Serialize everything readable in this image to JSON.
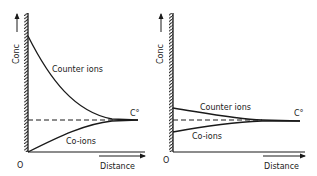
{
  "panels": [
    {
      "id": "left",
      "y_axis_label": "Conc",
      "x_axis_label": "Distance",
      "origin_label": "O",
      "bulk_label": "C°",
      "counter_label": "Counter ions",
      "co_label": "Co-ions",
      "description": "High surface charge: counter ions strongly enriched, co-ions strongly depleted near wall"
    },
    {
      "id": "right",
      "y_axis_label": "Conc",
      "x_axis_label": "Distance",
      "origin_label": "O",
      "bulk_label": "C°",
      "counter_label": "Counter ions",
      "co_label": "Co-ions",
      "description": "Low surface charge: counter ions slightly enriched, co-ions slightly depleted near wall"
    }
  ],
  "colors": {
    "ink": "#1a1a1a",
    "background": "#ffffff"
  }
}
